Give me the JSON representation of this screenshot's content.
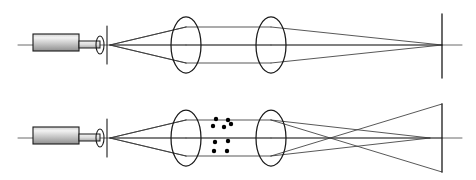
{
  "figure": {
    "width": 476,
    "height": 180,
    "background_color": "#ffffff",
    "stroke_color": "#1a1a1a",
    "ray_color": "#3a3a3a",
    "axis_color": "#5a5a5a",
    "particle_color": "#000000",
    "laser_body_fill_light": "#e8e8e8",
    "laser_body_fill_dark": "#9a9a9a"
  },
  "panels": [
    {
      "id": "top-panel",
      "name": "Clear beam path configuration",
      "axis_y": 45,
      "axis": {
        "x1": 18,
        "x2": 462,
        "y": 45
      },
      "laser": {
        "name": "laser-source",
        "x": 33,
        "y": 34,
        "width": 46,
        "height": 17,
        "label": "laser"
      },
      "laser_snout": {
        "name": "laser-snout",
        "x": 79,
        "y": 41,
        "width": 21,
        "height": 7
      },
      "objective_lens": {
        "name": "objective-lens",
        "cx": 100,
        "cy": 45,
        "rx": 4,
        "ry": 9
      },
      "pinhole": {
        "name": "pinhole-aperture",
        "x": 107,
        "y_top": 26,
        "y_bottom": 64
      },
      "focal_point": {
        "x": 110,
        "y": 45
      },
      "lens1": {
        "name": "collimating-lens",
        "cx": 186,
        "cy": 45,
        "rx": 15,
        "ry": 28
      },
      "lens2": {
        "name": "focusing-lens",
        "cx": 271,
        "cy": 45,
        "rx": 15,
        "ry": 28
      },
      "screen": {
        "name": "detector-screen",
        "x": 442,
        "y_top": 14,
        "y_bottom": 78
      },
      "image_point": {
        "x": 442,
        "y": 45
      },
      "ray_half_heights": [
        18,
        0,
        18
      ],
      "particles": []
    },
    {
      "id": "bottom-panel",
      "name": "Scattering particles configuration",
      "axis_y": 138,
      "axis": {
        "x1": 18,
        "x2": 462,
        "y": 138
      },
      "laser": {
        "name": "laser-source",
        "x": 33,
        "y": 127,
        "width": 46,
        "height": 17,
        "label": "laser"
      },
      "laser_snout": {
        "name": "laser-snout",
        "x": 79,
        "y": 134,
        "width": 21,
        "height": 7
      },
      "objective_lens": {
        "name": "objective-lens",
        "cx": 100,
        "cy": 138,
        "rx": 4,
        "ry": 9
      },
      "pinhole": {
        "name": "pinhole-aperture",
        "x": 107,
        "y_top": 119,
        "y_bottom": 157
      },
      "focal_point": {
        "x": 110,
        "y": 138
      },
      "lens1": {
        "name": "collimating-lens",
        "cx": 186,
        "cy": 138,
        "rx": 15,
        "ry": 28
      },
      "lens2": {
        "name": "focusing-lens",
        "cx": 271,
        "cy": 138,
        "rx": 15,
        "ry": 28
      },
      "screen": {
        "name": "detector-screen",
        "x": 442,
        "y_top": 104,
        "y_bottom": 172
      },
      "image_point": {
        "x": 442,
        "y": 138
      },
      "crossover_point": {
        "x": 430,
        "y": 138
      },
      "ray_half_heights": [
        18,
        0,
        18
      ],
      "particles": [
        {
          "cx": 216,
          "cy": 119,
          "r": 2.2
        },
        {
          "cx": 228,
          "cy": 120,
          "r": 2.2
        },
        {
          "cx": 213,
          "cy": 126,
          "r": 2.2
        },
        {
          "cx": 224,
          "cy": 127,
          "r": 2.2
        },
        {
          "cx": 231,
          "cy": 124,
          "r": 2.2
        },
        {
          "cx": 215,
          "cy": 142,
          "r": 2.2
        },
        {
          "cx": 228,
          "cy": 141,
          "r": 2.2
        },
        {
          "cx": 214,
          "cy": 151,
          "r": 2.2
        },
        {
          "cx": 227,
          "cy": 151,
          "r": 2.2
        }
      ]
    }
  ]
}
